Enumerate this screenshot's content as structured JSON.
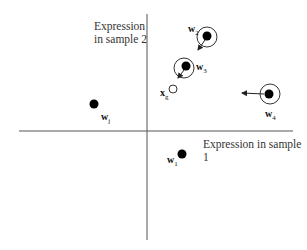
{
  "diagram": {
    "type": "vector-space-scatter",
    "axes": {
      "x_label": "Expression in sample 1",
      "y_label_line1": "Expression",
      "y_label_line2": "in sample 2",
      "origin": [
        147,
        131
      ],
      "color": "#555555"
    },
    "points": [
      {
        "id": "w1",
        "label_main": "w",
        "label_sub": "1",
        "x": 182,
        "y": 154,
        "filled": true,
        "ring": false,
        "arrow": null
      },
      {
        "id": "wj",
        "label_main": "w",
        "label_sub": "j",
        "x": 94,
        "y": 104,
        "filled": true,
        "ring": false,
        "arrow": null
      },
      {
        "id": "w2",
        "label_main": "w",
        "label_sub": "2",
        "x": 207,
        "y": 37,
        "filled": true,
        "ring": true,
        "arrow": [
          198,
          50
        ]
      },
      {
        "id": "w3",
        "label_main": "w",
        "label_sub": "3",
        "x": 185,
        "y": 67,
        "filled": true,
        "ring": true,
        "arrow": [
          178,
          78
        ]
      },
      {
        "id": "w4",
        "label_main": "w",
        "label_sub": "4",
        "x": 269,
        "y": 94,
        "filled": true,
        "ring": true,
        "arrow": [
          242,
          93
        ]
      },
      {
        "id": "xg",
        "label_main": "x",
        "label_sub": "g",
        "x": 173,
        "y": 89,
        "filled": false,
        "ring": false,
        "arrow": null
      }
    ],
    "colors": {
      "point_fill": "#000000",
      "ring_stroke": "#333333",
      "open_point_stroke": "#333333",
      "arrow": "#222222"
    }
  }
}
